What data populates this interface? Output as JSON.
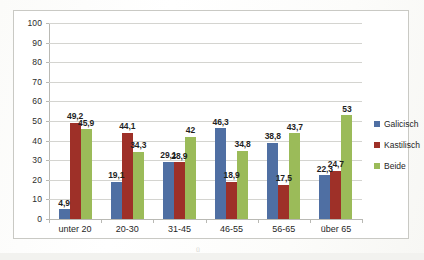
{
  "chart_data": {
    "type": "bar",
    "title": "",
    "xlabel": "",
    "ylabel": "",
    "ylim": [
      0,
      100
    ],
    "ytick_step": 10,
    "yticks": [
      0,
      10,
      20,
      30,
      40,
      50,
      60,
      70,
      80,
      90,
      100
    ],
    "grid": true,
    "legend_position": "right",
    "decimal_separator": ",",
    "categories": [
      "unter 20",
      "20-30",
      "31-45",
      "46-55",
      "56-65",
      "über 65"
    ],
    "series": [
      {
        "name": "Galicisch",
        "color": "#4f6fa3",
        "values": [
          4.9,
          19.1,
          29.1,
          46.3,
          38.8,
          22.3
        ],
        "labels": [
          "4,9",
          "19,1",
          "29,1",
          "46,3",
          "38,8",
          "22,3"
        ]
      },
      {
        "name": "Kastilisch",
        "color": "#9e3028",
        "values": [
          49.2,
          44.1,
          28.9,
          18.9,
          17.5,
          24.7
        ],
        "labels": [
          "49,2",
          "44,1",
          "28,9",
          "18,9",
          "17,5",
          "24,7"
        ]
      },
      {
        "name": "Beide",
        "color": "#9bbb59",
        "values": [
          45.9,
          34.3,
          42,
          34.8,
          43.7,
          53
        ],
        "labels": [
          "45,9",
          "34,3",
          "42",
          "34,8",
          "43,7",
          "53"
        ]
      }
    ]
  },
  "scan": {
    "artifact": "ü"
  }
}
